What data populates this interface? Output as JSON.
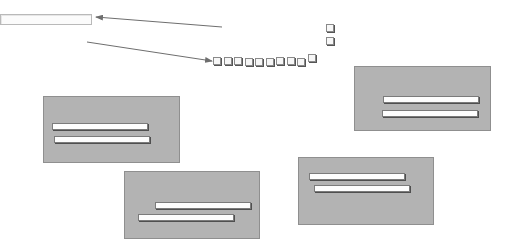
{
  "diagram": {
    "text_field": {
      "x": 0,
      "y": 14,
      "w": 92,
      "h": 11
    },
    "arrows": [
      {
        "from": [
          222,
          27
        ],
        "to": [
          96,
          17
        ]
      },
      {
        "from": [
          87,
          42
        ],
        "to": [
          212,
          61
        ]
      }
    ],
    "square_row": {
      "x": 213,
      "y": 57,
      "count": 10,
      "spacing": 10.5,
      "raised_last": true
    },
    "vertical_squares": [
      {
        "x": 326,
        "y": 24
      },
      {
        "x": 326,
        "y": 37
      }
    ],
    "panels": [
      {
        "id": "panel-left",
        "x": 43,
        "y": 96,
        "w": 137,
        "h": 67,
        "bars": [
          {
            "x": 8,
            "y": 26,
            "w": 96
          },
          {
            "x": 10,
            "y": 39,
            "w": 96
          }
        ]
      },
      {
        "id": "panel-top-right",
        "x": 354,
        "y": 66,
        "w": 137,
        "h": 65,
        "bars": [
          {
            "x": 28,
            "y": 29,
            "w": 96
          },
          {
            "x": 27,
            "y": 43,
            "w": 96
          }
        ]
      },
      {
        "id": "panel-bottom-center",
        "x": 124,
        "y": 171,
        "w": 136,
        "h": 68,
        "bars": [
          {
            "x": 30,
            "y": 30,
            "w": 96
          },
          {
            "x": 13,
            "y": 42,
            "w": 96
          }
        ]
      },
      {
        "id": "panel-bottom-right",
        "x": 298,
        "y": 157,
        "w": 136,
        "h": 68,
        "bars": [
          {
            "x": 10,
            "y": 15,
            "w": 96
          },
          {
            "x": 15,
            "y": 27,
            "w": 96
          }
        ]
      }
    ],
    "colors": {
      "panel_fill": "#b3b3b3",
      "panel_border": "#8f8f8f",
      "bar_fill": "#fdfdfd",
      "arrow": "#6e6e6e"
    }
  }
}
